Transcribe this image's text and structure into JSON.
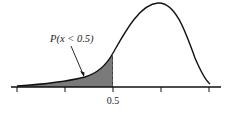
{
  "diagram": {
    "type": "probability-density-curve",
    "annotation_label": "P(x < 0.5)",
    "annotation_italic_var": "x",
    "x_tick_label": "0.5",
    "shaded_region": "left tail up to 0.5",
    "colors": {
      "curve": "#111111",
      "shade": "#7a7a7a",
      "axis": "#111111"
    },
    "tick_count": 5
  }
}
